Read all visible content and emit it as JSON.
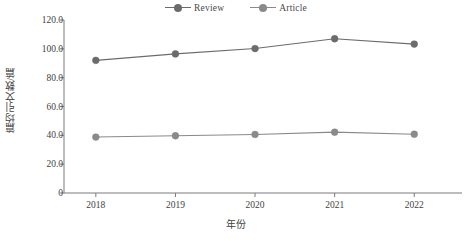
{
  "chart_data": {
    "type": "line",
    "title": "",
    "subtitle": "",
    "xlabel": "年份",
    "ylabel": "篇均引文数/篇",
    "categories": [
      "2018",
      "2019",
      "2020",
      "2021",
      "2022"
    ],
    "x": [
      2018,
      2019,
      2020,
      2021,
      2022
    ],
    "series": [
      {
        "name": "Review",
        "values": [
          92.0,
          96.5,
          100.2,
          107.0,
          103.3
        ],
        "color": "#6b6b6b",
        "marker": "circle"
      },
      {
        "name": "Article",
        "values": [
          38.8,
          39.7,
          40.6,
          42.2,
          40.8
        ],
        "color": "#8a8a8a",
        "marker": "circle"
      }
    ],
    "ylim": [
      0,
      120
    ],
    "xlim": [
      2017.6,
      2022.6
    ],
    "yticks": [
      0,
      20,
      40,
      60,
      80,
      100,
      120
    ],
    "ytick_labels": [
      "0",
      "20.0",
      "40.0",
      "60.0",
      "80.0",
      "100.0",
      "120.0"
    ],
    "xticks": [
      2018,
      2019,
      2020,
      2021,
      2022
    ],
    "xtick_labels": [
      "2018",
      "2019",
      "2020",
      "2021",
      "2022"
    ],
    "grid": false,
    "legend_position": "top-center",
    "axis_color": "#7a7a7a",
    "text_color": "#3f3f3f",
    "background": "#ffffff"
  },
  "legend": {
    "entries": [
      {
        "label": "Review"
      },
      {
        "label": "Article"
      }
    ]
  },
  "axes": {
    "x_title": "年份",
    "y_title": "篇均引文数/篇"
  }
}
